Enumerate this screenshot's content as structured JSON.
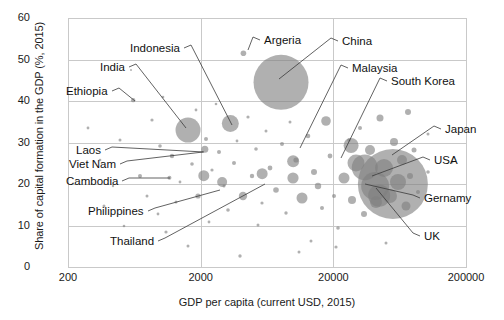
{
  "chart_data": {
    "type": "scatter",
    "title": "",
    "xlabel": "GDP per capita (current USD, 2015)",
    "ylabel": "Share of capital formation in the GDP (%, 2015)",
    "xscale": "log",
    "xlim": [
      200,
      200000
    ],
    "ylim": [
      0,
      60
    ],
    "xticks": [
      "200",
      "2000",
      "20000",
      "200000"
    ],
    "yticks": [
      "0",
      "10",
      "20",
      "30",
      "40",
      "50",
      "60"
    ],
    "grid": true,
    "legend": "none",
    "bubble_meaning": "bubble area ~ total capital formation / economy size",
    "labeled_points": [
      {
        "name": "Indonesia",
        "x": 3346,
        "y": 34.6,
        "r": 8.5
      },
      {
        "name": "India",
        "x": 1606,
        "y": 33.0,
        "r": 12.5
      },
      {
        "name": "Ethiopia",
        "x": 620,
        "y": 40.2,
        "r": 2.2
      },
      {
        "name": "Argeria",
        "x": 4200,
        "y": 51.5,
        "r": 2.8
      },
      {
        "name": "China",
        "x": 8069,
        "y": 44.5,
        "r": 27.5
      },
      {
        "name": "Malaysia",
        "x": 9955,
        "y": 25.5,
        "r": 6.0
      },
      {
        "name": "South Korea",
        "x": 27222,
        "y": 29.3,
        "r": 7.5
      },
      {
        "name": "Japan",
        "x": 34524,
        "y": 24.0,
        "r": 13.0
      },
      {
        "name": "USA",
        "x": 56207,
        "y": 20.0,
        "r": 35.0
      },
      {
        "name": "Gernamy",
        "x": 41313,
        "y": 19.5,
        "r": 14.0
      },
      {
        "name": "UK",
        "x": 44306,
        "y": 17.2,
        "r": 11.0
      },
      {
        "name": "Laos",
        "x": 2150,
        "y": 28.4,
        "r": 3.5
      },
      {
        "name": "Viet Nam",
        "x": 2111,
        "y": 22.0,
        "r": 5.5
      },
      {
        "name": "Cambodia",
        "x": 1163,
        "y": 21.5,
        "r": 2.0
      },
      {
        "name": "Philippines",
        "x": 2904,
        "y": 20.5,
        "r": 5.0
      },
      {
        "name": "Thailand",
        "x": 5815,
        "y": 22.5,
        "r": 5.5
      }
    ],
    "callouts": [
      {
        "label": "Indonesia",
        "tx": 130,
        "ty": 48,
        "anchor_x": 232,
        "anchor_y": 125
      },
      {
        "label": "India",
        "tx": 100,
        "ty": 67,
        "anchor_x": 186,
        "anchor_y": 128
      },
      {
        "label": "Ethiopia",
        "tx": 66,
        "ty": 91,
        "anchor_x": 135,
        "anchor_y": 101
      },
      {
        "label": "Argeria",
        "tx": 264,
        "ty": 40,
        "anchor_x": 248,
        "anchor_y": 50
      },
      {
        "label": "China",
        "tx": 342,
        "ty": 41,
        "anchor_x": 279,
        "anchor_y": 79
      },
      {
        "label": "Malaysia",
        "tx": 352,
        "ty": 68,
        "anchor_x": 300,
        "anchor_y": 148
      },
      {
        "label": "South Korea",
        "tx": 391,
        "ty": 81,
        "anchor_x": 341,
        "anchor_y": 158
      },
      {
        "label": "Japan",
        "tx": 445,
        "ty": 129,
        "anchor_x": 392,
        "anchor_y": 155
      },
      {
        "label": "USA",
        "tx": 434,
        "ty": 160,
        "anchor_x": 372,
        "anchor_y": 176
      },
      {
        "label": "Gernamy",
        "tx": 424,
        "ty": 198,
        "anchor_x": 365,
        "anchor_y": 184
      },
      {
        "label": "UK",
        "tx": 424,
        "ty": 236,
        "anchor_x": 376,
        "anchor_y": 188
      },
      {
        "label": "Laos",
        "tx": 76,
        "ty": 150,
        "anchor_x": 204,
        "anchor_y": 152
      },
      {
        "label": "Viet Nam",
        "tx": 69,
        "ty": 164,
        "anchor_x": 203,
        "anchor_y": 152
      },
      {
        "label": "Cambodia",
        "tx": 66,
        "ty": 181,
        "anchor_x": 170,
        "anchor_y": 178
      },
      {
        "label": "Philippines",
        "tx": 88,
        "ty": 211,
        "anchor_x": 220,
        "anchor_y": 190
      },
      {
        "label": "Thailand",
        "tx": 110,
        "ty": 241,
        "anchor_x": 265,
        "anchor_y": 184
      }
    ],
    "unlabeled_points": [
      {
        "x": 88,
        "y": 128,
        "r": 1.4
      },
      {
        "x": 100,
        "y": 160,
        "r": 1.3
      },
      {
        "x": 104,
        "y": 206,
        "r": 1.5
      },
      {
        "x": 113,
        "y": 186,
        "r": 1.2
      },
      {
        "x": 120,
        "y": 140,
        "r": 1.5
      },
      {
        "x": 124,
        "y": 226,
        "r": 1.3
      },
      {
        "x": 131,
        "y": 70,
        "r": 1.0
      },
      {
        "x": 140,
        "y": 176,
        "r": 2.0
      },
      {
        "x": 147,
        "y": 196,
        "r": 1.5
      },
      {
        "x": 152,
        "y": 120,
        "r": 1.6
      },
      {
        "x": 158,
        "y": 214,
        "r": 1.4
      },
      {
        "x": 160,
        "y": 146,
        "r": 1.8
      },
      {
        "x": 163,
        "y": 97,
        "r": 1.3
      },
      {
        "x": 166,
        "y": 232,
        "r": 1.6
      },
      {
        "x": 172,
        "y": 156,
        "r": 2.2
      },
      {
        "x": 176,
        "y": 202,
        "r": 1.5
      },
      {
        "x": 180,
        "y": 182,
        "r": 1.4
      },
      {
        "x": 188,
        "y": 246,
        "r": 1.5
      },
      {
        "x": 192,
        "y": 164,
        "r": 1.8
      },
      {
        "x": 196,
        "y": 110,
        "r": 1.4
      },
      {
        "x": 198,
        "y": 196,
        "r": 2.6
      },
      {
        "x": 206,
        "y": 139,
        "r": 2.0
      },
      {
        "x": 209,
        "y": 222,
        "r": 1.4
      },
      {
        "x": 212,
        "y": 170,
        "r": 1.6
      },
      {
        "x": 216,
        "y": 104,
        "r": 1.3
      },
      {
        "x": 219,
        "y": 152,
        "r": 2.0
      },
      {
        "x": 224,
        "y": 186,
        "r": 1.5
      },
      {
        "x": 228,
        "y": 210,
        "r": 1.8
      },
      {
        "x": 234,
        "y": 163,
        "r": 2.0
      },
      {
        "x": 237,
        "y": 141,
        "r": 1.4
      },
      {
        "x": 240,
        "y": 256,
        "r": 1.7
      },
      {
        "x": 243,
        "y": 196,
        "r": 4.2
      },
      {
        "x": 248,
        "y": 117,
        "r": 1.6
      },
      {
        "x": 252,
        "y": 176,
        "r": 2.2
      },
      {
        "x": 256,
        "y": 149,
        "r": 1.8
      },
      {
        "x": 258,
        "y": 225,
        "r": 1.5
      },
      {
        "x": 262,
        "y": 203,
        "r": 1.6
      },
      {
        "x": 266,
        "y": 131,
        "r": 1.5
      },
      {
        "x": 270,
        "y": 168,
        "r": 2.4
      },
      {
        "x": 276,
        "y": 190,
        "r": 2.8
      },
      {
        "x": 282,
        "y": 144,
        "r": 2.0
      },
      {
        "x": 286,
        "y": 213,
        "r": 1.7
      },
      {
        "x": 290,
        "y": 122,
        "r": 1.5
      },
      {
        "x": 293,
        "y": 178,
        "r": 5.6
      },
      {
        "x": 296,
        "y": 160,
        "r": 2.6
      },
      {
        "x": 302,
        "y": 198,
        "r": 5.5
      },
      {
        "x": 308,
        "y": 136,
        "r": 2.3
      },
      {
        "x": 311,
        "y": 241,
        "r": 1.5
      },
      {
        "x": 314,
        "y": 172,
        "r": 3.0
      },
      {
        "x": 318,
        "y": 186,
        "r": 3.2
      },
      {
        "x": 322,
        "y": 208,
        "r": 2.0
      },
      {
        "x": 326,
        "y": 121,
        "r": 4.8
      },
      {
        "x": 330,
        "y": 156,
        "r": 2.4
      },
      {
        "x": 334,
        "y": 196,
        "r": 2.0
      },
      {
        "x": 338,
        "y": 228,
        "r": 1.8
      },
      {
        "x": 344,
        "y": 178,
        "r": 5.5
      },
      {
        "x": 349,
        "y": 140,
        "r": 1.8
      },
      {
        "x": 352,
        "y": 200,
        "r": 4.0
      },
      {
        "x": 356,
        "y": 163,
        "r": 8.5
      },
      {
        "x": 360,
        "y": 128,
        "r": 2.0
      },
      {
        "x": 364,
        "y": 214,
        "r": 3.0
      },
      {
        "x": 370,
        "y": 150,
        "r": 5.0
      },
      {
        "x": 376,
        "y": 202,
        "r": 6.0
      },
      {
        "x": 380,
        "y": 118,
        "r": 3.5
      },
      {
        "x": 384,
        "y": 168,
        "r": 9.0
      },
      {
        "x": 390,
        "y": 196,
        "r": 7.0
      },
      {
        "x": 394,
        "y": 142,
        "r": 4.0
      },
      {
        "x": 398,
        "y": 182,
        "r": 8.0
      },
      {
        "x": 402,
        "y": 160,
        "r": 5.0
      },
      {
        "x": 406,
        "y": 206,
        "r": 4.5
      },
      {
        "x": 410,
        "y": 176,
        "r": 3.0
      },
      {
        "x": 414,
        "y": 150,
        "r": 2.5
      },
      {
        "x": 418,
        "y": 192,
        "r": 2.0
      },
      {
        "x": 408,
        "y": 112,
        "r": 3.0
      },
      {
        "x": 428,
        "y": 172,
        "r": 1.8
      },
      {
        "x": 336,
        "y": 247,
        "r": 1.6
      },
      {
        "x": 299,
        "y": 252,
        "r": 1.5
      },
      {
        "x": 428,
        "y": 134,
        "r": 1.5
      },
      {
        "x": 452,
        "y": 162,
        "r": 1.5
      },
      {
        "x": 386,
        "y": 243,
        "r": 1.5
      }
    ]
  },
  "axis": {
    "y_title": "Share of capital formation in the GDP (%, 2015)",
    "x_title": "GDP per capita (current USD, 2015)"
  }
}
